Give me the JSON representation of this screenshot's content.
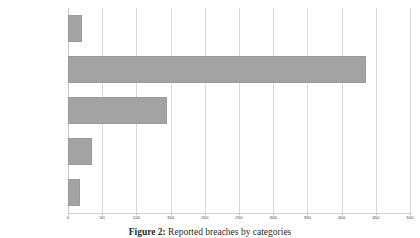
{
  "chart_data": {
    "type": "bar",
    "orientation": "horizontal",
    "title": "",
    "xlabel": "",
    "ylabel": "",
    "categories": [
      "Human Mistakes",
      "Hacking/ Vulnerability Exploit",
      "Access Violation",
      "Theft",
      "Loss"
    ],
    "values": [
      20,
      435,
      145,
      35,
      17
    ],
    "xlim": [
      0,
      500
    ],
    "xticks": [
      0,
      50,
      100,
      150,
      200,
      250,
      300,
      350,
      400,
      450,
      500
    ],
    "xtick_labels": [
      "0",
      "50",
      "100",
      "150",
      "200",
      "250",
      "300",
      "350",
      "400",
      "450",
      "500"
    ],
    "grid": true,
    "grid_axis": "x",
    "legend": false,
    "bar_color": "#a3a3a3",
    "bar_edge_color": "#9a9a9a",
    "grid_color": "#d9d9d9",
    "background_color": "#ffffff"
  },
  "caption": {
    "label": "Figure 2:",
    "text": "Reported breaches by categories"
  }
}
